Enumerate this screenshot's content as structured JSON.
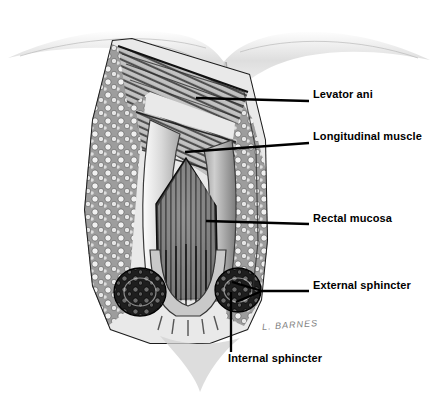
{
  "figure": {
    "kind": "anatomical-illustration",
    "medium": "pen-and-ink / graphite grayscale drawing",
    "background_color": "#ffffff",
    "ink_color": "#000000",
    "signature": "L. BARNES"
  },
  "labels": [
    {
      "id": "levator-ani",
      "text": "Levator ani",
      "x": 313,
      "y": 94,
      "leader": {
        "x1": 196,
        "y1": 98,
        "x2": 309,
        "y2": 101,
        "type": "straight"
      }
    },
    {
      "id": "longitudinal-muscle",
      "text": "Longitudinal muscle",
      "x": 313,
      "y": 136,
      "leader": {
        "x1": 185,
        "y1": 152,
        "x2": 309,
        "y2": 143,
        "type": "straight"
      }
    },
    {
      "id": "rectal-mucosa",
      "text": "Rectal mucosa",
      "x": 313,
      "y": 218,
      "leader": {
        "x1": 206,
        "y1": 221,
        "x2": 309,
        "y2": 224,
        "type": "straight"
      }
    },
    {
      "id": "external-sphincter",
      "text": "External sphincter",
      "x": 313,
      "y": 285,
      "leader": {
        "x1": 232,
        "y1": 288,
        "x2": 309,
        "y2": 291,
        "type": "forked"
      }
    },
    {
      "id": "internal-sphincter",
      "text": "Internal sphincter",
      "x": 228,
      "y": 358,
      "leader": {
        "x1": 231,
        "y1": 292,
        "x2": 231,
        "y2": 352,
        "type": "vertical"
      }
    }
  ],
  "structures": [
    {
      "name": "gluteal-skin-fold",
      "note": "soft graphite buttock contour across top"
    },
    {
      "name": "ischiorectal-fat",
      "note": "stippled lobular fat packing the flanks"
    },
    {
      "name": "levator-ani-muscle",
      "note": "striated muscle sheet sweeping down from above"
    },
    {
      "name": "longitudinal-muscle",
      "note": "vertical striated fibres of the rectal wall"
    },
    {
      "name": "rectal-mucosa",
      "note": "pale folded lining lifted open"
    },
    {
      "name": "anal-canal-lumen",
      "note": "dark inverted-V cavity with columns of Morgagni"
    },
    {
      "name": "internal-sphincter",
      "note": "smooth muscle ring bordering the canal"
    },
    {
      "name": "external-sphincter",
      "note": "dark clustered muscle bundles in cross-section"
    },
    {
      "name": "anal-verge",
      "note": "radiating skin folds at the lower margin"
    }
  ]
}
